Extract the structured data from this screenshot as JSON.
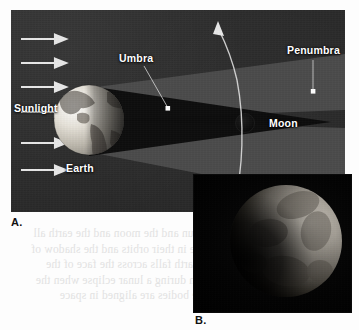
{
  "figure": {
    "panels": [
      {
        "letter": "A.",
        "kind": "diagram",
        "labels": {
          "sunlight": "Sunlight",
          "earth": "Earth",
          "umbra": "Umbra",
          "penumbra": "Penumbra",
          "moon": "Moon"
        }
      },
      {
        "letter": "B.",
        "kind": "photograph"
      }
    ],
    "ghost_text": "the sun and the moon and the earth all move in their orbits and the shadow of the earth falls across the face of the moon during a lunar eclipse when the three bodies are aligned in space"
  },
  "colors": {
    "sky": "#2b2b2b",
    "umbra": "#0a0a0a",
    "penumbra": "#4d4d4d",
    "label_text": "#ffffff",
    "panel_letter": "#111111",
    "arrow": "#e8e8e8",
    "leader_line": "#d8d8d8",
    "marker_dot": "#ffffff",
    "earth_lit": "#e4e0d8",
    "earth_dark": "#6e6a64",
    "moon_disc": "#0d0d0d",
    "photo_bg": "#000000",
    "ghost": "#e2e2e2"
  }
}
